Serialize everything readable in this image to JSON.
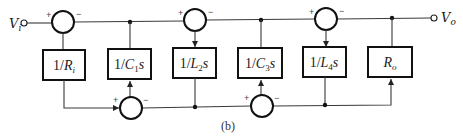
{
  "figure": {
    "caption": "(b)",
    "input": {
      "label": "V",
      "subscript": "i"
    },
    "output": {
      "label": "V",
      "subscript": "o"
    }
  },
  "blocks": [
    {
      "id": "Ri",
      "num": "1/",
      "var": "R",
      "sub": "i",
      "tail": ""
    },
    {
      "id": "C1",
      "num": "1/",
      "var": "C",
      "sub": "1",
      "tail": "s"
    },
    {
      "id": "L2",
      "num": "1/",
      "var": "L",
      "sub": "2",
      "tail": "s"
    },
    {
      "id": "C3",
      "num": "1/",
      "var": "C",
      "sub": "3",
      "tail": "s"
    },
    {
      "id": "L4",
      "num": "1/",
      "var": "L",
      "sub": "4",
      "tail": "s"
    },
    {
      "id": "Ro",
      "num": "",
      "var": "R",
      "sub": "o",
      "tail": ""
    }
  ],
  "summing_junctions": {
    "top": [
      {
        "plus": "+",
        "minus": "−"
      },
      {
        "plus": "+",
        "minus": "−"
      },
      {
        "plus": "+",
        "minus": "−"
      }
    ],
    "bottom": [
      {
        "plus": "+",
        "minus": "−"
      },
      {
        "plus": "+",
        "minus": "−"
      }
    ]
  }
}
